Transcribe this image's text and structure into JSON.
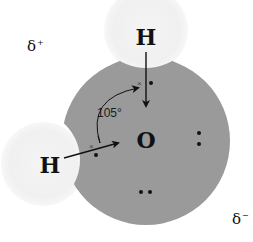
{
  "diagram": {
    "molecule": "water",
    "atoms": {
      "oxygen": {
        "symbol": "O"
      },
      "hydrogen_top": {
        "symbol": "H"
      },
      "hydrogen_left": {
        "symbol": "H"
      }
    },
    "bond_angle": {
      "label": "105°"
    },
    "charges": {
      "positive": {
        "symbol": "δ",
        "sign": "+"
      },
      "negative": {
        "symbol": "δ",
        "sign": "−"
      }
    },
    "electron_markers": {
      "cross": "×"
    },
    "colors": {
      "oxygen_fill": "#999999",
      "hydrogen_fill": "#f2f2f2",
      "ink": "#111111",
      "background": "#ffffff"
    }
  }
}
